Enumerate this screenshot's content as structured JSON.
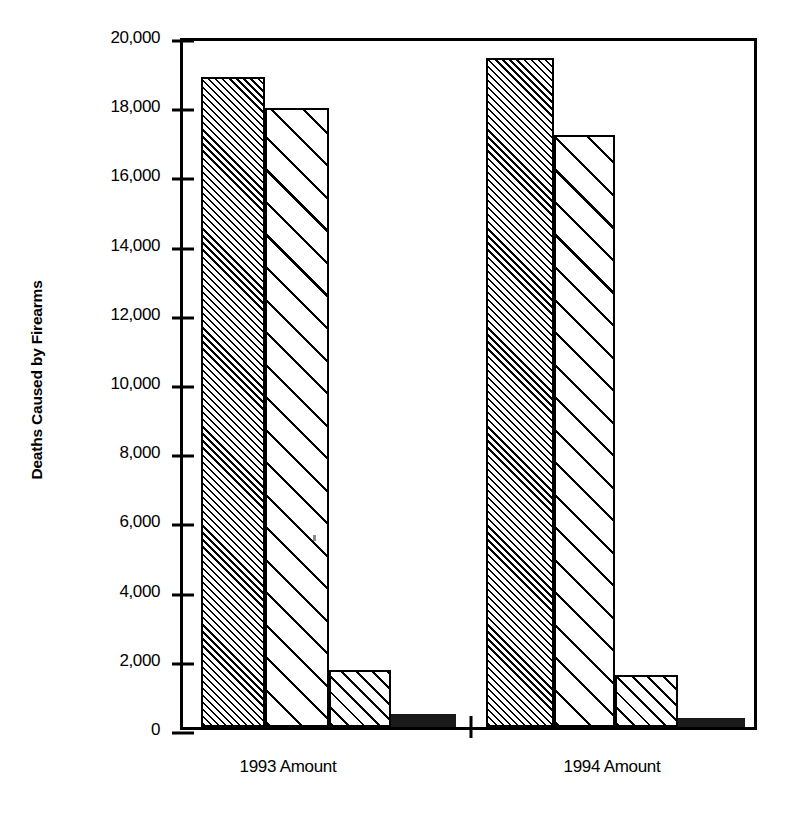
{
  "chart_data": {
    "type": "bar",
    "title": "",
    "xlabel": "",
    "ylabel": "Deaths Caused by Firearms",
    "ylim": [
      0,
      20000
    ],
    "grid": false,
    "legend": "none",
    "categories": [
      "1993 Amount",
      "1994 Amount"
    ],
    "ytick_labels": [
      "20,000",
      "18,000",
      "16,000",
      "14,000",
      "12,000",
      "10,000",
      "8,000",
      "6,000",
      "4,000",
      "2,000",
      "0"
    ],
    "ytick_values": [
      20000,
      18000,
      16000,
      14000,
      12000,
      10000,
      8000,
      6000,
      4000,
      2000,
      0
    ],
    "series": [
      {
        "name": "Series 1",
        "pattern": "dense-diagonal-hatch",
        "values": [
          18800,
          19350
        ]
      },
      {
        "name": "Series 2",
        "pattern": "sparse-diagonal-hatch",
        "values": [
          17900,
          17100
        ]
      },
      {
        "name": "Series 3",
        "pattern": "medium-diagonal-hatch",
        "values": [
          1650,
          1500
        ]
      },
      {
        "name": "Series 4",
        "pattern": "solid-black",
        "values": [
          380,
          250
        ]
      }
    ],
    "bars": [
      {
        "group": "1993 Amount",
        "series": "Series 1",
        "value": 18800,
        "pattern": "dense-diagonal-hatch"
      },
      {
        "group": "1993 Amount",
        "series": "Series 2",
        "value": 17900,
        "pattern": "sparse-diagonal-hatch"
      },
      {
        "group": "1993 Amount",
        "series": "Series 3",
        "value": 1650,
        "pattern": "medium-diagonal-hatch"
      },
      {
        "group": "1993 Amount",
        "series": "Series 4",
        "value": 380,
        "pattern": "solid-black"
      },
      {
        "group": "1994 Amount",
        "series": "Series 1",
        "value": 19350,
        "pattern": "dense-diagonal-hatch"
      },
      {
        "group": "1994 Amount",
        "series": "Series 2",
        "value": 17100,
        "pattern": "sparse-diagonal-hatch"
      },
      {
        "group": "1994 Amount",
        "series": "Series 3",
        "value": 1500,
        "pattern": "medium-diagonal-hatch"
      },
      {
        "group": "1994 Amount",
        "series": "Series 4",
        "value": 250,
        "pattern": "solid-black"
      }
    ],
    "colors": {
      "ink": "#000000",
      "background": "#ffffff",
      "solid_bar": "#1a1a1a"
    }
  }
}
